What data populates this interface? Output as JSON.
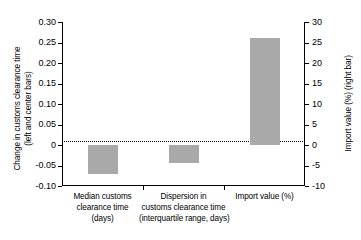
{
  "chart_data": {
    "type": "bar",
    "title": "",
    "xlabel": "",
    "categories": [
      "Median customs clearance time (days)",
      "Dispersion in customs clearance time (interquartile range, days)",
      "Import value (%)"
    ],
    "category_lines": [
      [
        "Median customs",
        "clearance time",
        "(days)"
      ],
      [
        "Dispersion in",
        "customs clearance time",
        "(interquartile range, days)"
      ],
      [
        "Import value (%)"
      ]
    ],
    "values": [
      -0.07,
      -0.045,
      26
    ],
    "value_axis_assignment": [
      "left",
      "left",
      "right"
    ],
    "bar_color": "#a9a9a9",
    "grid": false,
    "legend": "none",
    "zero_reference_line": true,
    "axes": {
      "left": {
        "label": "Change in customs clearance time (left and center bars)",
        "label_lines": [
          "Change in customs clearance time",
          "(left and center bars)"
        ],
        "ylim": [
          -0.1,
          0.3
        ],
        "ticks": [
          0.3,
          0.25,
          0.2,
          0.15,
          0.1,
          0.05,
          0,
          -0.05,
          -0.1
        ],
        "tick_labels": [
          "0.30",
          "0.25",
          "0.20",
          "0.15",
          "0.10",
          "0.05",
          "0",
          "-0.05",
          "-0.10"
        ]
      },
      "right": {
        "label": "Import value (%) (right bar)",
        "ylim": [
          -10,
          30
        ],
        "ticks": [
          30,
          25,
          20,
          15,
          10,
          5,
          0,
          -5,
          -10
        ],
        "tick_labels": [
          "30",
          "25",
          "20",
          "15",
          "10",
          "5",
          "0",
          "-5",
          "-10"
        ]
      }
    }
  }
}
